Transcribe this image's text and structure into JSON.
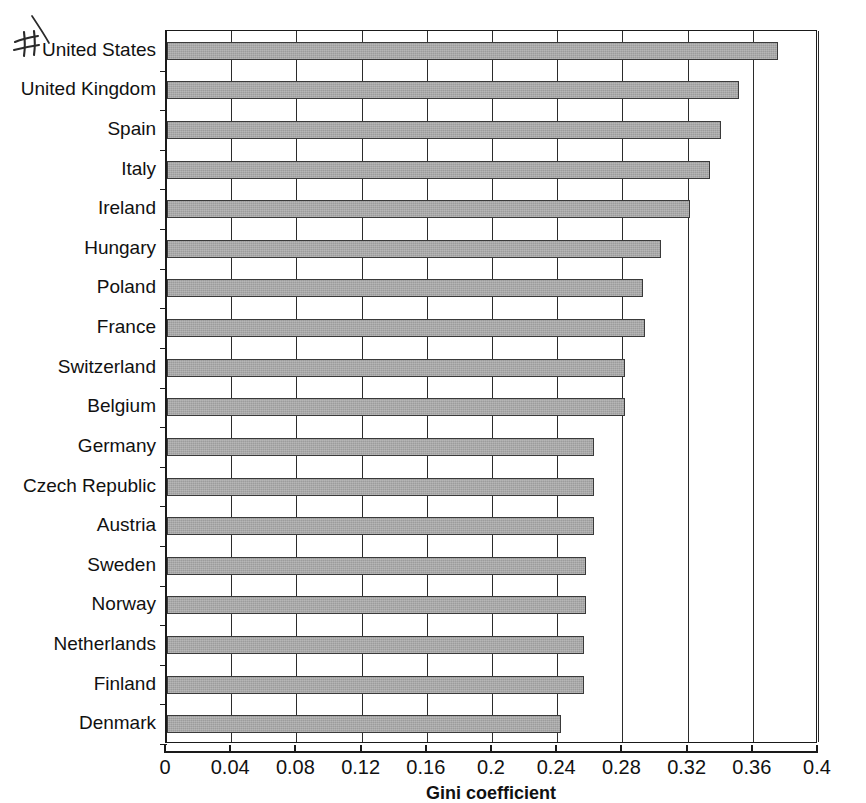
{
  "chart_data": {
    "type": "bar",
    "orientation": "horizontal",
    "title": "",
    "xlabel": "Gini coefficient",
    "ylabel": "",
    "xlim": [
      0,
      0.4
    ],
    "xticks": [
      "0",
      "0.04",
      "0.08",
      "0.12",
      "0.16",
      "0.2",
      "0.24",
      "0.28",
      "0.32",
      "0.36",
      "0.4"
    ],
    "xtick_values": [
      0,
      0.04,
      0.08,
      0.12,
      0.16,
      0.2,
      0.24,
      0.28,
      0.32,
      0.36,
      0.4
    ],
    "grid": true,
    "grid_axis": "x",
    "legend": false,
    "bar_color": "#9c9c9c",
    "bar_edge_color": "#3a3a3a",
    "categories": [
      "United States",
      "United Kingdom",
      "Spain",
      "Italy",
      "Ireland",
      "Hungary",
      "Poland",
      "France",
      "Switzerland",
      "Belgium",
      "Germany",
      "Czech Republic",
      "Austria",
      "Sweden",
      "Norway",
      "Netherlands",
      "Finland",
      "Denmark"
    ],
    "values": [
      0.375,
      0.351,
      0.34,
      0.333,
      0.321,
      0.303,
      0.292,
      0.293,
      0.281,
      0.281,
      0.262,
      0.262,
      0.262,
      0.257,
      0.257,
      0.256,
      0.256,
      0.242
    ]
  },
  "annotation": {
    "handwritten_mark": "handwritten-hash-mark-with-leader-line"
  }
}
